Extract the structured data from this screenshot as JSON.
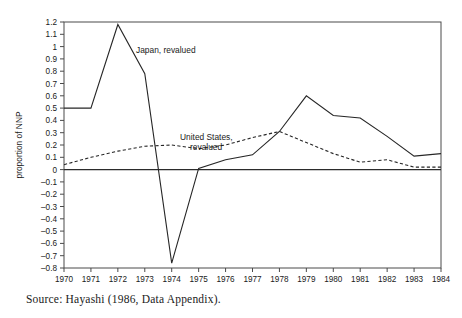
{
  "caption": "Source: Hayashi (1986, Data Appendix).",
  "chart_data": {
    "type": "line",
    "title": "",
    "xlabel": "",
    "ylabel": "proportion of NNP",
    "x": [
      1970,
      1971,
      1972,
      1973,
      1974,
      1975,
      1976,
      1977,
      1978,
      1979,
      1980,
      1981,
      1982,
      1983,
      1984
    ],
    "categories": [
      "1970",
      "1971",
      "1972",
      "1973",
      "1974",
      "1975",
      "1976",
      "1977",
      "1978",
      "1979",
      "1980",
      "1981",
      "1982",
      "1983",
      "1984"
    ],
    "xlim": [
      1970,
      1984
    ],
    "ylim": [
      -0.8,
      1.2
    ],
    "ytick_labels": [
      "1.2",
      "1.1",
      "1",
      "0.9",
      "0.8",
      "0.7",
      "0.6",
      "0.5",
      "0.4",
      "0.3",
      "0.2",
      "0.1",
      "0",
      "-0.1",
      "-0.2",
      "-0.3",
      "-0.4",
      "-0.5",
      "-0.6",
      "-0.7",
      "-0.8"
    ],
    "ytick_values": [
      1.2,
      1.1,
      1.0,
      0.9,
      0.8,
      0.7,
      0.6,
      0.5,
      0.4,
      0.3,
      0.2,
      0.1,
      0.0,
      -0.1,
      -0.2,
      -0.3,
      -0.4,
      -0.5,
      -0.6,
      -0.7,
      -0.8
    ],
    "grid": false,
    "legend_position": "inline-annotation",
    "zero_line": true,
    "series": [
      {
        "name": "Japan, revalued",
        "style": "solid",
        "label_text": "Japan, revalued",
        "values": [
          0.5,
          0.5,
          1.18,
          0.78,
          -0.76,
          0.01,
          0.08,
          0.12,
          0.31,
          0.6,
          0.44,
          0.42,
          0.27,
          0.11,
          0.13
        ]
      },
      {
        "name": "United States, revalued",
        "style": "dashed",
        "label_text_line1": "United States,",
        "label_text_line2": "revalued",
        "values": [
          0.04,
          0.1,
          0.15,
          0.19,
          0.2,
          0.17,
          0.2,
          0.26,
          0.31,
          0.22,
          0.13,
          0.06,
          0.08,
          0.02,
          0.02
        ]
      }
    ]
  }
}
